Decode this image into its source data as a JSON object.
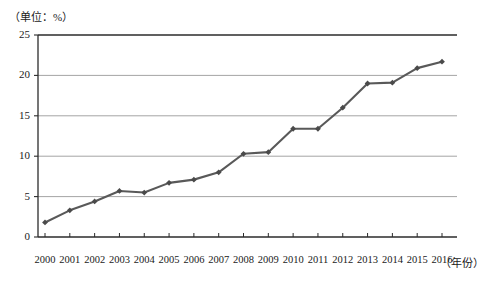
{
  "chart_data": {
    "type": "line",
    "title": "",
    "subtitle": "",
    "unit_note": "（单位：%）",
    "xlabel": "（年份）",
    "ylabel": "",
    "categories": [
      "2000",
      "2001",
      "2002",
      "2003",
      "2004",
      "2005",
      "2006",
      "2007",
      "2008",
      "2009",
      "2010",
      "2011",
      "2012",
      "2013",
      "2014",
      "2015",
      "2016"
    ],
    "values": [
      1.8,
      3.3,
      4.4,
      5.7,
      5.5,
      6.7,
      7.1,
      8.0,
      10.3,
      10.5,
      13.4,
      13.4,
      16.0,
      19.0,
      19.1,
      20.9,
      21.7
    ],
    "series": [
      {
        "name": "",
        "values": [
          1.8,
          3.3,
          4.4,
          5.7,
          5.5,
          6.7,
          7.1,
          8.0,
          10.3,
          10.5,
          13.4,
          13.4,
          16.0,
          19.0,
          19.1,
          20.9,
          21.7
        ]
      }
    ],
    "ylim": [
      0,
      25
    ],
    "yticks": [
      0,
      5,
      10,
      15,
      20,
      25
    ],
    "ytick_labels": [
      "0",
      "5",
      "10",
      "15",
      "20",
      "25"
    ],
    "xtick_labels": [
      "2000",
      "2001",
      "2002",
      "2003",
      "2004",
      "2005",
      "2006",
      "2007",
      "2008",
      "2009",
      "2010",
      "2011",
      "2012",
      "2013",
      "2014",
      "2015",
      "2016"
    ],
    "grid": true,
    "grid_axis": "y",
    "legend": false,
    "legend_position": "none",
    "marker": "diamond",
    "line_color": "#595959",
    "marker_color": "#4a4a4a",
    "grid_color": "#9a9a9a",
    "axis_color": "#2b2b2b",
    "background_color": "#ffffff"
  }
}
